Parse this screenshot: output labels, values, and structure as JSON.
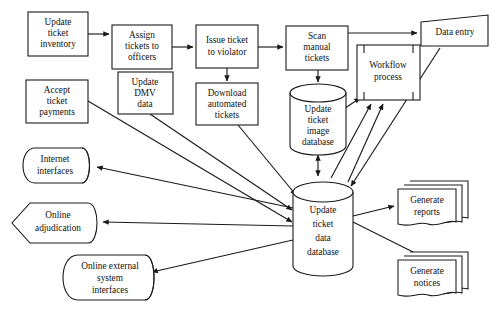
{
  "diagram": {
    "line_color": "#1a1a1a",
    "background_color": "#ffffff",
    "nodes": {
      "update_ticket_inventory": {
        "label": "Update ticket inventory",
        "lines": [
          "Update",
          "ticket",
          "inventory"
        ],
        "shape": "rectangle"
      },
      "assign_tickets_to_officers": {
        "label": "Assign tickets to officers",
        "lines": [
          "Assign",
          "tickets to",
          "officers"
        ],
        "shape": "rectangle"
      },
      "issue_ticket_to_violator": {
        "label": "Issue ticket to violator",
        "lines": [
          "Issue ticket",
          "to violator"
        ],
        "shape": "rectangle"
      },
      "scan_manual_tickets": {
        "label": "Scan manual tickets",
        "lines": [
          "Scan",
          "manual",
          "tickets"
        ],
        "shape": "rectangle"
      },
      "data_entry": {
        "label": "Data entry",
        "lines": [
          "Data entry"
        ],
        "shape": "skewed-quadrilateral"
      },
      "update_dmv_data": {
        "label": "Update DMV data",
        "lines": [
          "Update",
          "DMV",
          "data"
        ],
        "shape": "rectangle"
      },
      "accept_ticket_payments": {
        "label": "Accept ticket payments",
        "lines": [
          "Accept",
          "ticket",
          "payments"
        ],
        "shape": "rectangle"
      },
      "download_automated_tickets": {
        "label": "Download automated tickets",
        "lines": [
          "Download",
          "automated",
          "tickets"
        ],
        "shape": "rectangle"
      },
      "workflow_process": {
        "label": "Workflow process",
        "lines": [
          "Workflow",
          "process"
        ],
        "shape": "bracketed-rectangle"
      },
      "update_ticket_image_database": {
        "label": "Update ticket image database",
        "lines": [
          "Update",
          "ticket",
          "image",
          "database"
        ],
        "shape": "cylinder"
      },
      "update_ticket_data_database": {
        "label": "Update ticket data database",
        "lines": [
          "Update",
          "ticket",
          "data",
          "database"
        ],
        "shape": "cylinder"
      },
      "internet_interfaces": {
        "label": "Internet interfaces",
        "lines": [
          "Internet",
          "interfaces"
        ],
        "shape": "banner"
      },
      "online_adjudication": {
        "label": "Online adjudication",
        "lines": [
          "Online",
          "adjudication"
        ],
        "shape": "hexagon-banner"
      },
      "online_external_system_interfaces": {
        "label": "Online external system interfaces",
        "lines": [
          "Online external",
          "system",
          "interfaces"
        ],
        "shape": "banner"
      },
      "generate_reports": {
        "label": "Generate reports",
        "lines": [
          "Generate",
          "reports"
        ],
        "shape": "multi-document"
      },
      "generate_notices": {
        "label": "Generate notices",
        "lines": [
          "Generate",
          "notices"
        ],
        "shape": "multi-document"
      }
    },
    "edges": [
      {
        "from": "update_ticket_inventory",
        "to": "assign_tickets_to_officers",
        "arrow": "single"
      },
      {
        "from": "assign_tickets_to_officers",
        "to": "issue_ticket_to_violator",
        "arrow": "single"
      },
      {
        "from": "issue_ticket_to_violator",
        "to": "scan_manual_tickets",
        "arrow": "single"
      },
      {
        "from": "issue_ticket_to_violator",
        "to": "download_automated_tickets",
        "arrow": "single"
      },
      {
        "from": "scan_manual_tickets",
        "to": "data_entry",
        "arrow": "single"
      },
      {
        "from": "scan_manual_tickets",
        "to": "update_ticket_image_database",
        "arrow": "single"
      },
      {
        "from": "update_ticket_image_database",
        "to": "update_ticket_data_database",
        "arrow": "double"
      },
      {
        "from": "workflow_process",
        "to": "update_ticket_image_database",
        "arrow": "double"
      },
      {
        "from": "update_ticket_data_database",
        "to": "workflow_process",
        "arrow": "single"
      },
      {
        "from": "data_entry",
        "to": "update_ticket_data_database",
        "arrow": "single"
      },
      {
        "from": "update_dmv_data",
        "to": "update_ticket_data_database",
        "arrow": "single"
      },
      {
        "from": "accept_ticket_payments",
        "to": "update_ticket_data_database",
        "arrow": "single"
      },
      {
        "from": "download_automated_tickets",
        "to": "update_ticket_data_database",
        "arrow": "single"
      },
      {
        "from": "update_ticket_data_database",
        "to": "internet_interfaces",
        "arrow": "single"
      },
      {
        "from": "update_ticket_data_database",
        "to": "online_adjudication",
        "arrow": "single"
      },
      {
        "from": "update_ticket_data_database",
        "to": "online_external_system_interfaces",
        "arrow": "single"
      },
      {
        "from": "update_ticket_data_database",
        "to": "generate_reports",
        "arrow": "single"
      },
      {
        "from": "update_ticket_data_database",
        "to": "generate_notices",
        "arrow": "single"
      }
    ]
  }
}
